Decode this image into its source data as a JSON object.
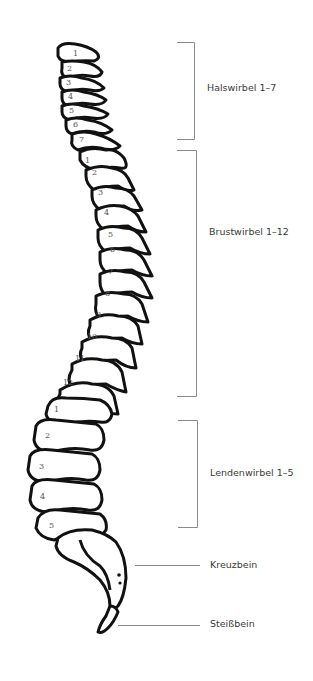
{
  "diagram": {
    "regions": [
      {
        "label": "Halswirbel 1–7",
        "count": 7,
        "bracket": {
          "top": 42,
          "bottom": 139,
          "x": 194
        }
      },
      {
        "label": "Brustwirbel 1–12",
        "count": 12,
        "bracket": {
          "top": 150,
          "bottom": 396,
          "x": 196
        }
      },
      {
        "label": "Lendenwirbel 1–5",
        "count": 5,
        "bracket": {
          "top": 420,
          "bottom": 527,
          "x": 197
        }
      },
      {
        "label": "Kreuzbein",
        "pointer_y": 565
      },
      {
        "label": "Steißbein",
        "pointer_y": 625
      }
    ],
    "vertebra_numbers": {
      "cervical": [
        "1",
        "2",
        "3",
        "4",
        "5",
        "6",
        "7"
      ],
      "thoracic": [
        "1",
        "2",
        "3",
        "4",
        "5",
        "6",
        "7",
        "8",
        "9",
        "10",
        "11",
        "12"
      ],
      "lumbar": [
        "1",
        "2",
        "3",
        "4",
        "5"
      ]
    },
    "colors": {
      "outline": "#111111",
      "bracket": "#8a8a8a",
      "label": "#3a3a3a",
      "number": "#555555"
    }
  }
}
